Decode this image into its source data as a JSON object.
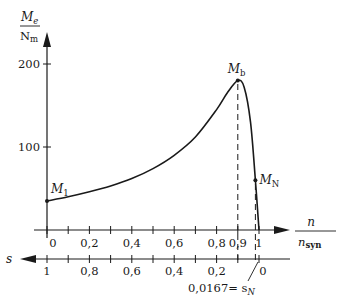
{
  "chart_data": {
    "type": "line",
    "title": "",
    "ylabel": "M_e / N_m",
    "ylabel_num": "M",
    "ylabel_num_sub": "e",
    "ylabel_den": "N",
    "ylabel_den_sub": "m",
    "xlabel_num": "n",
    "xlabel_den": "n",
    "xlabel_den_sub": "syn",
    "x2label": "s",
    "ylim": [
      0,
      200
    ],
    "xlim": [
      0,
      1
    ],
    "yticks": [
      100,
      200
    ],
    "ytick_labels": [
      "100",
      "200"
    ],
    "xticks": [
      0,
      0.1,
      0.2,
      0.3,
      0.4,
      0.5,
      0.6,
      0.7,
      0.8,
      0.9,
      1.0
    ],
    "xtick_labels": {
      "0": "0",
      "0.2": "0,2",
      "0.4": "0,4",
      "0.6": "0,6",
      "0.8": "0,8",
      "0.9": "0,9",
      "1": "1"
    },
    "x2tick_labels": [
      "1",
      "0,8",
      "0,6",
      "0,4",
      "0,2",
      "0"
    ],
    "x2tick_positions": [
      0,
      0.2,
      0.4,
      0.6,
      0.8,
      1.0
    ],
    "sN_annotation": "0,0167= s",
    "sN_sub": "N",
    "series": [
      {
        "name": "M_e(n)",
        "x": [
          0,
          0.1,
          0.2,
          0.3,
          0.4,
          0.5,
          0.6,
          0.7,
          0.8,
          0.85,
          0.9,
          0.93,
          0.96,
          0.983,
          1.0
        ],
        "values": [
          35,
          40,
          46,
          53,
          62,
          74,
          90,
          112,
          145,
          165,
          180,
          172,
          130,
          60,
          0
        ]
      }
    ],
    "points": [
      {
        "label": "M",
        "sub": "1",
        "x": 0,
        "y": 35
      },
      {
        "label": "M",
        "sub": "b",
        "x": 0.9,
        "y": 180
      },
      {
        "label": "M",
        "sub": "N",
        "x": 0.983,
        "y": 60
      }
    ],
    "guides": [
      {
        "type": "dashed-vertical",
        "x": 0.9,
        "from_y": 0,
        "to_y": 180
      },
      {
        "type": "dashed-vertical",
        "x": 0.983,
        "from_y": 0,
        "to_y": 60
      }
    ]
  }
}
